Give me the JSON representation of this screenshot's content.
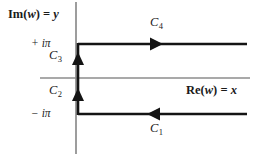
{
  "figure": {
    "type": "complex-plane-contour-diagram",
    "width": 263,
    "height": 156,
    "background_color": "#ffffff"
  },
  "axes": {
    "imaginary_axis_label": "Im(w) = y",
    "imaginary_axis_label_parts": {
      "prefix": "Im(",
      "variable": "w",
      "middle": ") = ",
      "value": "y"
    },
    "real_axis_label": "Re(w) = x",
    "real_axis_label_parts": {
      "prefix": "Re(",
      "variable": "w",
      "middle": ") = ",
      "value": "x"
    },
    "axis_color": "#8c8c8c",
    "vertical_axis_x": 76,
    "horizontal_axis_y": 78
  },
  "ticks": [
    {
      "label": "+ iπ",
      "value": "+iπ",
      "y": 44
    },
    {
      "label": "− iπ",
      "value": "-iπ",
      "y": 114
    }
  ],
  "contour": {
    "color": "#141414",
    "stroke_width": 2.6,
    "segments": [
      {
        "name": "C1",
        "base": "C",
        "subscript": "1",
        "orientation": "horizontal",
        "direction": "leftward",
        "y": 114,
        "x_start": 247,
        "x_end": 78,
        "arrow_x": 155,
        "label_x": 150,
        "label_y": 126
      },
      {
        "name": "C2",
        "base": "C",
        "subscript": "2",
        "orientation": "vertical",
        "direction": "upward",
        "x": 78,
        "y_start": 114,
        "y_end": 78,
        "arrow_y": 95,
        "label_x": 49,
        "label_y": 90
      },
      {
        "name": "C3",
        "base": "C",
        "subscript": "3",
        "orientation": "vertical",
        "direction": "upward",
        "x": 78,
        "y_start": 78,
        "y_end": 44,
        "arrow_y": 59,
        "label_x": 49,
        "label_y": 55
      },
      {
        "name": "C4",
        "base": "C",
        "subscript": "4",
        "orientation": "horizontal",
        "direction": "rightward",
        "y": 44,
        "x_start": 78,
        "x_end": 247,
        "arrow_x": 155,
        "label_x": 150,
        "label_y": 22
      }
    ]
  }
}
